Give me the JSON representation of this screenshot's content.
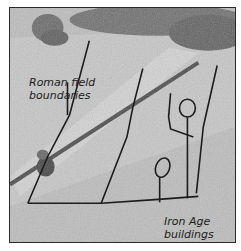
{
  "figure": {
    "type": "annotated aerial photograph",
    "annotations": {
      "roman": {
        "line1": "Roman field",
        "line2": "boundaries"
      },
      "iron_age": {
        "line1": "Iron Age",
        "line2": "buildings"
      }
    },
    "colors": {
      "field": "#b9b9b9",
      "trees": "#5a5a5a",
      "ink": "#1c1c1c",
      "road_strip": "#d4d4d4"
    }
  }
}
